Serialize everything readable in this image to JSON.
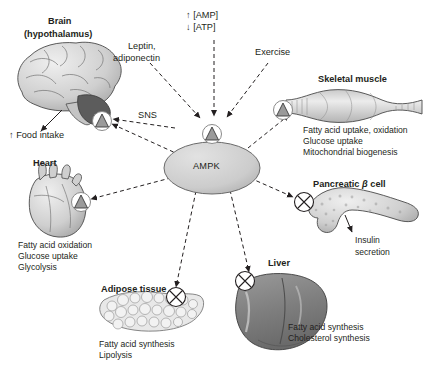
{
  "diagram": {
    "type": "signaling-pathway",
    "center": {
      "label": "AMPK",
      "shape": "ellipse"
    },
    "symbols": {
      "activation": "circle-triangle-icon",
      "inhibition": "circle-x-icon"
    },
    "upstream_inputs": [
      {
        "label": "Leptin,\nadiponectin",
        "effect": "activation"
      },
      {
        "label": "↑ [AMP]\n↓ [ATP]",
        "effect": "activation"
      },
      {
        "label": "Exercise",
        "effect": "activation"
      }
    ],
    "sns_label": "SNS",
    "targets": [
      {
        "name": "brain",
        "title": "Brain\n(hypothalamus)",
        "effect": "activation",
        "outputs": "↑ Food intake",
        "effects_list": []
      },
      {
        "name": "skeletal-muscle",
        "title": "Skeletal muscle",
        "effect": "activation",
        "effects_list": [
          "Fatty acid uptake, oxidation",
          "Glucose uptake",
          "Mitochondrial biogenesis"
        ]
      },
      {
        "name": "heart",
        "title": "Heart",
        "effect": "activation",
        "effects_list": [
          "Fatty acid oxidation",
          "Glucose uptake",
          "Glycolysis"
        ]
      },
      {
        "name": "pancreatic-beta-cell",
        "title": "Pancreatic β cell",
        "effect": "inhibition",
        "outputs": "Insulin\nsecretion",
        "effects_list": []
      },
      {
        "name": "adipose-tissue",
        "title": "Adipose tissue",
        "effect": "inhibition",
        "effects_list": [
          "Fatty acid synthesis",
          "Lipolysis"
        ]
      },
      {
        "name": "liver",
        "title": "Liver",
        "effect": "inhibition",
        "effects_list": [
          "Fatty acid synthesis",
          "Cholesterol synthesis"
        ]
      }
    ],
    "colors": {
      "ink": "#231f20",
      "organ_light": "#d9d9d9",
      "organ_mid": "#bfbfbf",
      "organ_dark": "#8a8a8a",
      "hub_fill": "#d2d2d2"
    }
  },
  "labels": {
    "brain_title_l1": "Brain",
    "brain_title_l2": "(hypothalamus)",
    "food_intake": "↑ Food intake",
    "leptin_l1": "Leptin,",
    "leptin_l2": "adiponectin",
    "amp_l1": "↑ [AMP]",
    "amp_l2": "↓ [ATP]",
    "exercise": "Exercise",
    "sns": "SNS",
    "ampk": "AMPK",
    "muscle_title": "Skeletal muscle",
    "muscle_e1": "Fatty acid uptake, oxidation",
    "muscle_e2": "Glucose uptake",
    "muscle_e3": "Mitochondrial biogenesis",
    "heart_title": "Heart",
    "heart_e1": "Fatty acid oxidation",
    "heart_e2": "Glucose uptake",
    "heart_e3": "Glycolysis",
    "pancreas_title_a": "Pancreatic ",
    "pancreas_title_b": "β",
    "pancreas_title_c": " cell",
    "insulin_l1": "Insulin",
    "insulin_l2": "secretion",
    "adipose_title": "Adipose tissue",
    "adipose_e1": "Fatty acid synthesis",
    "adipose_e2": "Lipolysis",
    "liver_title": "Liver",
    "liver_e1": "Fatty acid synthesis",
    "liver_e2": "Cholesterol synthesis"
  }
}
